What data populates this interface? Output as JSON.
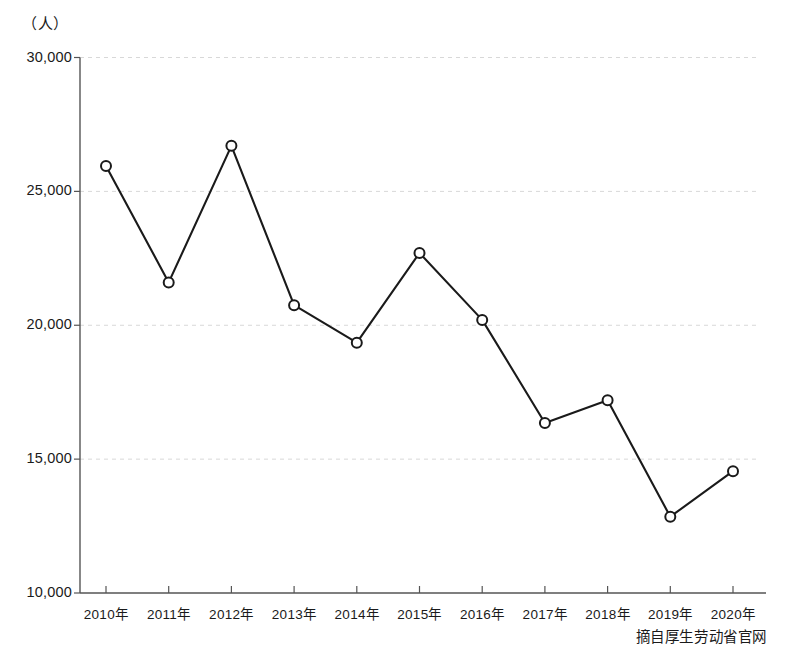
{
  "chart_data": {
    "type": "line",
    "title": "",
    "subtitle": "",
    "unit_label": "（人）",
    "xlabel": "",
    "ylabel": "",
    "categories": [
      "2010年",
      "2011年",
      "2012年",
      "2013年",
      "2014年",
      "2015年",
      "2016年",
      "2017年",
      "2018年",
      "2019年",
      "2020年"
    ],
    "values": [
      25950,
      21600,
      26700,
      20750,
      19350,
      22700,
      20200,
      16350,
      17200,
      12850,
      14550
    ],
    "series": [
      {
        "name": "",
        "values": [
          25950,
          21600,
          26700,
          20750,
          19350,
          22700,
          20200,
          16350,
          17200,
          12850,
          14550
        ]
      }
    ],
    "ylim": [
      10000,
      30000
    ],
    "yticks": [
      10000,
      15000,
      20000,
      25000,
      30000
    ],
    "ytick_labels": [
      "10,000",
      "15,000",
      "20,000",
      "25,000",
      "30,000"
    ],
    "grid": true,
    "grid_style": "dashed-horizontal",
    "legend": false,
    "legend_position": "none",
    "marker": "open-circle",
    "line_color": "#1a1a1a",
    "marker_fill": "#ffffff",
    "grid_color": "#d8d8d8",
    "axis_color": "#555555",
    "annotations": []
  },
  "footer": {
    "source": "摘自厚生劳动省官网"
  }
}
